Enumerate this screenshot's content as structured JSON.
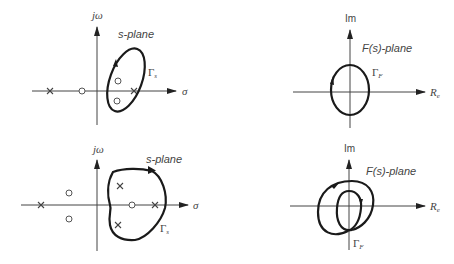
{
  "figure": {
    "panels": [
      {
        "id": "top-left",
        "plane_label": "s-plane",
        "vertical_axis_label": "jω",
        "horizontal_axis_label": "σ",
        "contour_label": "Γ",
        "contour_subscript": "s",
        "poles": [
          {
            "x": -3,
            "y": 0
          },
          {
            "x": 2,
            "y": 0
          }
        ],
        "zeros": [
          {
            "x": -1,
            "y": 0
          },
          {
            "x": 1,
            "y": 0.5
          },
          {
            "x": 1,
            "y": -0.5
          }
        ],
        "contour_shape": "tilted ellipse enclosing 1 pole and 2 zeros",
        "contour_direction": "clockwise"
      },
      {
        "id": "top-right",
        "plane_label": "F(s)-plane",
        "vertical_axis_label": "Im",
        "horizontal_axis_label": "R",
        "horizontal_axis_subscript": "e",
        "contour_label": "Γ",
        "contour_subscript": "F",
        "contour_shape": "ellipse encircling origin once",
        "contour_direction": "clockwise"
      },
      {
        "id": "bottom-left",
        "plane_label": "s-plane",
        "vertical_axis_label": "jω",
        "horizontal_axis_label": "σ",
        "contour_label": "Γ",
        "contour_subscript": "s",
        "poles": [
          {
            "x": -3,
            "y": 0
          },
          {
            "x": 0.5,
            "y": 0.8
          },
          {
            "x": 0.5,
            "y": -0.8
          },
          {
            "x": 2,
            "y": 0
          }
        ],
        "zeros": [
          {
            "x": -1.5,
            "y": 0.5
          },
          {
            "x": -1.5,
            "y": -0.5
          },
          {
            "x": 1.2,
            "y": 0
          }
        ],
        "contour_shape": "rounded triangular contour enclosing 3 poles and 1 zero",
        "contour_direction": "clockwise"
      },
      {
        "id": "bottom-right",
        "plane_label": "F(s)-plane",
        "vertical_axis_label": "Im",
        "horizontal_axis_label": "R",
        "horizontal_axis_subscript": "e",
        "contour_label": "Γ",
        "contour_subscript": "F",
        "contour_shape": "looped contour encircling origin twice",
        "contour_direction": "counterclockwise"
      }
    ]
  }
}
